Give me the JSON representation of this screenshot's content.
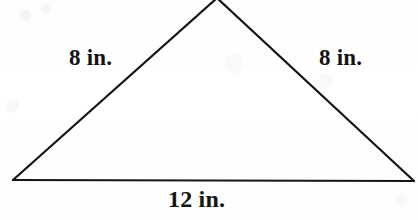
{
  "figure": {
    "name": "isosceles-triangle-with-side-lengths",
    "background_color": "#fefefe",
    "stroke_color": "#141414",
    "stroke_width": 2.2,
    "width": 418,
    "height": 220
  },
  "shape": {
    "type": "triangle",
    "classification": "isosceles",
    "vertices": {
      "apex": {
        "x": 217,
        "y": -2
      },
      "bottom_left": {
        "x": 13,
        "y": 180
      },
      "bottom_right": {
        "x": 414,
        "y": 181
      }
    },
    "polygon_points": "217,-2 13,180 414,181"
  },
  "labels": {
    "left_side": "8 in.",
    "right_side": "8 in.",
    "base": "12 in."
  },
  "measurements": {
    "left_side_value": 8,
    "right_side_value": 8,
    "base_value": 12,
    "unit": "in."
  }
}
